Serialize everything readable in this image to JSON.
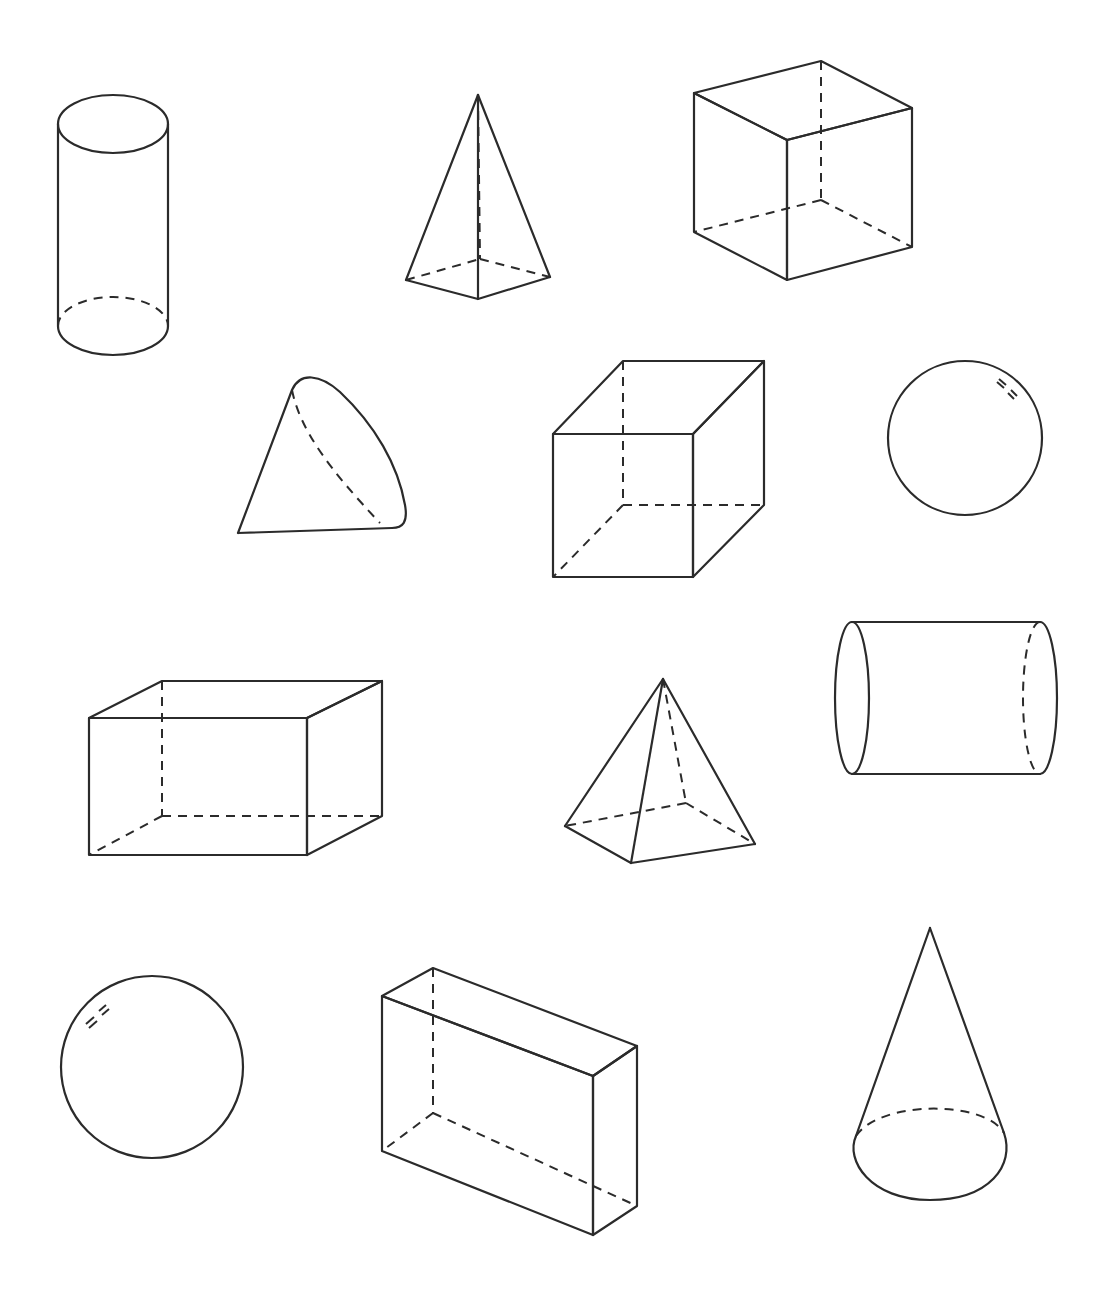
{
  "page": {
    "title": "3D geometric solids worksheet",
    "background": "#ffffff",
    "line_color": "#2b2b2b"
  },
  "shapes": [
    {
      "id": 1,
      "label": "Cylinder (upright)",
      "row": 1
    },
    {
      "id": 2,
      "label": "Square pyramid",
      "row": 1
    },
    {
      "id": 3,
      "label": "Cube",
      "row": 1
    },
    {
      "id": 4,
      "label": "Cone (tilted)",
      "row": 2
    },
    {
      "id": 5,
      "label": "Cube",
      "row": 2
    },
    {
      "id": 6,
      "label": "Sphere",
      "row": 2
    },
    {
      "id": 7,
      "label": "Rectangular prism",
      "row": 3
    },
    {
      "id": 8,
      "label": "Square pyramid",
      "row": 3
    },
    {
      "id": 9,
      "label": "Cylinder (horizontal)",
      "row": 3
    },
    {
      "id": 10,
      "label": "Sphere",
      "row": 4
    },
    {
      "id": 11,
      "label": "Rectangular prism",
      "row": 4
    },
    {
      "id": 12,
      "label": "Cone (upright)",
      "row": 4
    }
  ]
}
